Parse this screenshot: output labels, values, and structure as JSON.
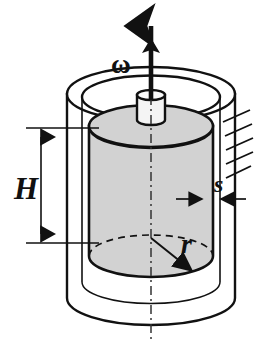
{
  "diagram": {
    "type": "engineering-cross-section",
    "background_color": "#ffffff",
    "labels": {
      "angular_velocity": "ω",
      "height": "H",
      "radius": "r",
      "gap": "s"
    },
    "colors": {
      "outline": "#111111",
      "rotor_fill": "#d2d2d2",
      "cup_fill": "#ffffff",
      "shaft_fill": "#f2f2f2",
      "dimension_line": "#111111",
      "centerline": "#333333",
      "hatch": "#111111"
    },
    "elements": {
      "outer_cup": {
        "name": "outer-cup",
        "center_x": 151,
        "top_rim_cy": 94,
        "bottom_cy": 298,
        "rx": 84,
        "ry": 27,
        "inner_rx": 69,
        "inner_ry": 21
      },
      "inner_rotor": {
        "name": "inner-rotor-cylinder",
        "center_x": 151,
        "top_cy": 126,
        "bottom_cy": 256,
        "rx": 62,
        "ry": 21,
        "height_px": 130
      },
      "shaft": {
        "name": "drive-shaft",
        "center_x": 151,
        "top_cy": 95,
        "bottom_cy": 120,
        "rx": 14,
        "ry": 5
      },
      "rotation_arrow": {
        "name": "angular-velocity-arrow",
        "x": 151,
        "y_tip": 14,
        "y_tail": 100,
        "heads": 2
      },
      "height_dimension": {
        "name": "height-dimension",
        "x": 40,
        "y_top": 128,
        "y_bottom": 243,
        "ext_top_y": 128,
        "ext_bottom_y": 243,
        "ext_x_start": 26,
        "ext_x_end": 96
      },
      "gap_dimension": {
        "name": "gap-dimension",
        "y": 199,
        "x_inner_edge": 203,
        "x_outer_edge": 218,
        "arrow_left_from": 176,
        "arrow_right_from": 245
      },
      "radius_dimension": {
        "name": "radius-dimension",
        "x_start": 151,
        "y_start": 240,
        "x_end": 193,
        "y_end": 272
      },
      "fixed_support_hatching": {
        "name": "fixed-support-hatching",
        "line_count": 5,
        "anchor_x": 222,
        "y_start": 118,
        "y_step": 14,
        "length": 26
      },
      "centerline": {
        "name": "axis-centerline",
        "x": 151,
        "y_top": 96,
        "y_bottom": 340,
        "style": "dash-dot"
      }
    },
    "label_positions": {
      "angular_velocity": {
        "x": 112,
        "y": 68
      },
      "height": {
        "x": 14,
        "y": 198
      },
      "radius": {
        "x": 182,
        "y": 250
      },
      "gap": {
        "x": 222,
        "y": 190
      }
    }
  }
}
